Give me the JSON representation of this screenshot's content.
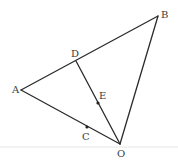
{
  "diagram": {
    "type": "geometry-figure",
    "points": {
      "A": {
        "label": "A",
        "x": 21,
        "y": 90,
        "lx": 12,
        "ly": 93
      },
      "B": {
        "label": "B",
        "x": 158,
        "y": 16,
        "lx": 161,
        "ly": 18
      },
      "O": {
        "label": "O",
        "x": 120,
        "y": 144,
        "lx": 117,
        "ly": 157
      },
      "D": {
        "label": "D",
        "x": 76,
        "y": 61,
        "lx": 71,
        "ly": 57
      },
      "E": {
        "label": "E",
        "x": 98,
        "y": 103,
        "lx": 99,
        "ly": 99
      },
      "C": {
        "label": "C",
        "x": 87,
        "y": 127,
        "lx": 82,
        "ly": 140
      }
    },
    "segments": [
      {
        "from": "A",
        "to": "B"
      },
      {
        "from": "B",
        "to": "O"
      },
      {
        "from": "O",
        "to": "A"
      },
      {
        "from": "D",
        "to": "O"
      }
    ],
    "marked_points": [
      "E",
      "C"
    ],
    "colors": {
      "stroke": "#2b2b2b",
      "label": "#3a3a3a",
      "background": "#ffffff"
    }
  }
}
